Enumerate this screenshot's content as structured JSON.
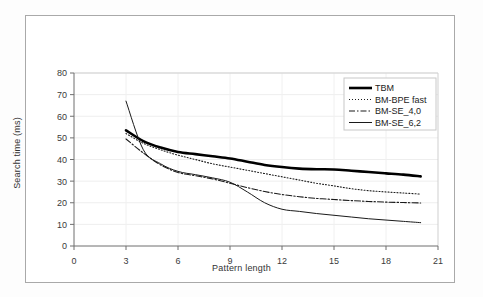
{
  "chart_data": {
    "type": "line",
    "title": "",
    "xlabel": "Pattern length",
    "ylabel": "Search time (ms)",
    "xlim": [
      0,
      21
    ],
    "ylim": [
      0,
      80
    ],
    "xticks": [
      0,
      3,
      6,
      9,
      12,
      15,
      18,
      21
    ],
    "yticks": [
      0,
      10,
      20,
      30,
      40,
      50,
      60,
      70,
      80
    ],
    "grid": true,
    "grid_axis": "y",
    "legend_position": "top-right",
    "x": [
      3,
      4,
      5,
      6,
      7,
      8,
      9,
      10,
      11,
      12,
      13,
      14,
      15,
      16,
      17,
      18,
      19,
      20
    ],
    "series": [
      {
        "name": "TBM",
        "style": "solid-thick",
        "color": "#000000",
        "values": [
          53.5,
          48.5,
          45.5,
          43.5,
          42.5,
          41.5,
          40.5,
          39.0,
          37.5,
          36.5,
          35.8,
          35.5,
          35.4,
          34.8,
          34.2,
          33.6,
          33.0,
          32.2
        ]
      },
      {
        "name": "BM-BPE fast",
        "style": "dotted",
        "color": "#1a1a1a",
        "values": [
          52.0,
          47.5,
          44.5,
          42.0,
          40.0,
          38.0,
          36.5,
          35.0,
          33.5,
          32.0,
          30.5,
          29.0,
          27.8,
          26.5,
          25.6,
          25.0,
          24.5,
          24.0
        ]
      },
      {
        "name": "BM-SE_4,0",
        "style": "dash-dot",
        "color": "#1a1a1a",
        "values": [
          49.5,
          43.0,
          37.5,
          34.0,
          32.5,
          31.0,
          29.0,
          27.0,
          25.2,
          23.8,
          22.8,
          22.0,
          21.5,
          21.0,
          20.6,
          20.3,
          20.1,
          19.9
        ]
      },
      {
        "name": "BM-SE_6,2",
        "style": "solid-thin",
        "color": "#1a1a1a",
        "values": [
          67.0,
          44.5,
          38.0,
          34.5,
          33.0,
          31.5,
          29.5,
          25.0,
          20.0,
          17.0,
          16.0,
          15.0,
          14.2,
          13.4,
          12.6,
          12.0,
          11.4,
          10.8
        ]
      }
    ]
  },
  "legend": {
    "items": [
      {
        "label": "TBM"
      },
      {
        "label": "BM-BPE fast"
      },
      {
        "label": "BM-SE_4,0"
      },
      {
        "label": "BM-SE_6,2"
      }
    ]
  }
}
